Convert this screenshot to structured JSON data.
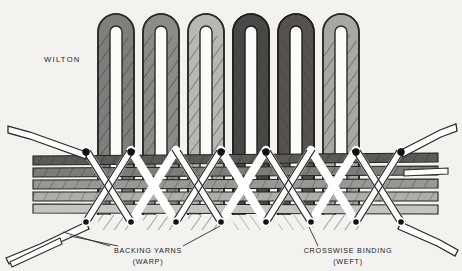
{
  "figure": {
    "title_label": "WILTON",
    "background_color": "#f3f2ef",
    "ink_color": "#1a1a1a"
  },
  "annotations": [
    {
      "id": "backing-yarns",
      "line1": "BACKING YARNS",
      "line2": "(WARP)",
      "x": 148,
      "y": 253
    },
    {
      "id": "crosswise-binding",
      "line1": "CROSSWISE BINDING",
      "line2": "(WEFT)",
      "x": 348,
      "y": 253
    }
  ],
  "pile_loops": {
    "count": 6,
    "description": "U-shaped pile yarn loops rising above the backing",
    "shades": [
      "#807e7b",
      "#8d8b87",
      "#b9b7b2",
      "#4a4846",
      "#56534f",
      "#a9a7a2"
    ],
    "centers_x": [
      116,
      161,
      206,
      251,
      296,
      341
    ],
    "top_y": 14,
    "outer_width": 36,
    "stroke": "#2b2a28"
  },
  "backing_bands": {
    "count": 5,
    "description": "Horizontal backing weft bands seen edge-on",
    "colors": [
      "#5c5a57",
      "#7e7c78",
      "#9a9894",
      "#b0aeaa",
      "#c6c4c0"
    ],
    "y_positions": [
      156,
      168,
      180,
      192,
      204
    ],
    "band_height": 9,
    "left_edge": 33,
    "right_edge": 438
  },
  "binding_threads": {
    "description": "Crosswise binding yarn drawn as interlacing zig-zag ribbons",
    "color": "#ffffff",
    "stroke": "#2b2a28",
    "top_vertices_y": 152,
    "bottom_vertices_y": 222,
    "node_color": "#111111",
    "node_radius": 3.4
  },
  "protruding_ends": {
    "description": "Cut binding-yarn ends extending beyond the fabric at left and right",
    "left_count": 3,
    "right_count": 3
  },
  "colors": {
    "paper": "#f3f2ef",
    "ink": "#1a1a1a",
    "yarn_white": "#ffffff",
    "node": "#111111",
    "dark_pile": "#4a4846",
    "mid_pile": "#8d8b87",
    "light_pile": "#b9b7b2"
  }
}
